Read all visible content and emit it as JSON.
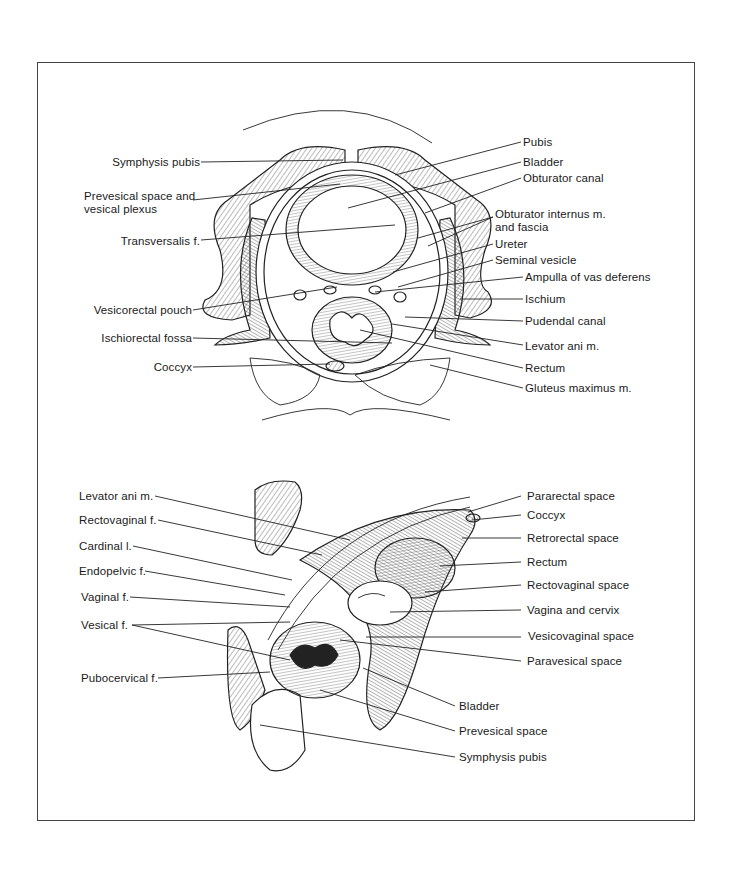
{
  "figures": [
    {
      "id": "male-pelvis-cross-section",
      "labels_left": [
        "Symphysis pubis",
        "Prevesical space and\nvesical plexus",
        "Transversalis f.",
        "Vesicorectal pouch",
        "Ischiorectal fossa",
        "Coccyx"
      ],
      "labels_right": [
        "Pubis",
        "Bladder",
        "Obturator canal",
        "Obturator internus m.\nand fascia",
        "Ureter",
        "Seminal vesicle",
        "Ampulla of vas deferens",
        "Ischium",
        "Pudendal canal",
        "Levator ani m.",
        "Rectum",
        "Gluteus maximus m."
      ]
    },
    {
      "id": "female-pelvis-oblique-section",
      "labels_left": [
        "Levator ani m.",
        "Rectovaginal f.",
        "Cardinal l.",
        "Endopelvic f.",
        "Vaginal f.",
        "Vesical f.",
        "Pubocervical f."
      ],
      "labels_right": [
        "Pararectal space",
        "Coccyx",
        "Retrorectal space",
        "Rectum",
        "Rectovaginal space",
        "Vagina and cervix",
        "Vesicovaginal space",
        "Paravesical space",
        "Bladder",
        "Prevesical space",
        "Symphysis pubis"
      ]
    }
  ]
}
